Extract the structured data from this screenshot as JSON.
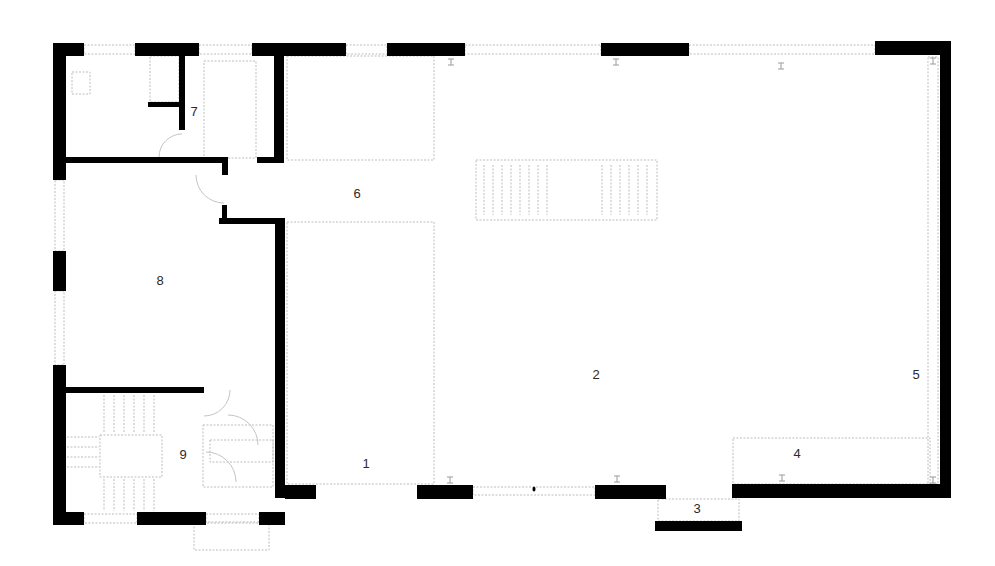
{
  "plan": {
    "title": "Floor plan",
    "background": "#ffffff",
    "wall_color": "#000000",
    "line_color": "#bdbdbd"
  },
  "rooms": [
    {
      "id": "1",
      "label": "1",
      "x": 366,
      "y": 465
    },
    {
      "id": "2",
      "label": "2",
      "x": 596,
      "y": 376
    },
    {
      "id": "3",
      "label": "3",
      "x": 697,
      "y": 510
    },
    {
      "id": "4",
      "label": "4",
      "x": 797,
      "y": 455
    },
    {
      "id": "5",
      "label": "5",
      "x": 916,
      "y": 376
    },
    {
      "id": "6",
      "label": "6",
      "x": 357,
      "y": 195
    },
    {
      "id": "7",
      "label": "7",
      "x": 194,
      "y": 113
    },
    {
      "id": "8",
      "label": "8",
      "x": 160,
      "y": 282
    },
    {
      "id": "9",
      "label": "9",
      "x": 183,
      "y": 456
    }
  ],
  "walls": [
    {
      "x": 53,
      "y": 43,
      "w": 31,
      "h": 13
    },
    {
      "x": 53,
      "y": 43,
      "w": 13,
      "h": 137
    },
    {
      "x": 135,
      "y": 43,
      "w": 64,
      "h": 13
    },
    {
      "x": 252,
      "y": 43,
      "w": 94,
      "h": 13
    },
    {
      "x": 387,
      "y": 43,
      "w": 78,
      "h": 13
    },
    {
      "x": 601,
      "y": 43,
      "w": 88,
      "h": 13
    },
    {
      "x": 875,
      "y": 41,
      "w": 76,
      "h": 14
    },
    {
      "x": 940,
      "y": 41,
      "w": 11,
      "h": 455
    },
    {
      "x": 179,
      "y": 56,
      "w": 6,
      "h": 74
    },
    {
      "x": 148,
      "y": 102,
      "w": 37,
      "h": 5
    },
    {
      "x": 274,
      "y": 56,
      "w": 10,
      "h": 107
    },
    {
      "x": 257,
      "y": 157,
      "w": 27,
      "h": 6
    },
    {
      "x": 66,
      "y": 157,
      "w": 162,
      "h": 6
    },
    {
      "x": 222,
      "y": 157,
      "w": 6,
      "h": 18
    },
    {
      "x": 222,
      "y": 205,
      "w": 5,
      "h": 17
    },
    {
      "x": 219,
      "y": 218,
      "w": 66,
      "h": 6
    },
    {
      "x": 275,
      "y": 218,
      "w": 10,
      "h": 280
    },
    {
      "x": 53,
      "y": 251,
      "w": 13,
      "h": 40
    },
    {
      "x": 53,
      "y": 365,
      "w": 13,
      "h": 160
    },
    {
      "x": 66,
      "y": 387,
      "w": 138,
      "h": 6
    },
    {
      "x": 53,
      "y": 512,
      "w": 31,
      "h": 13
    },
    {
      "x": 137,
      "y": 512,
      "w": 69,
      "h": 13
    },
    {
      "x": 259,
      "y": 512,
      "w": 26,
      "h": 13
    },
    {
      "x": 285,
      "y": 485,
      "w": 31,
      "h": 14
    },
    {
      "x": 417,
      "y": 485,
      "w": 56,
      "h": 14
    },
    {
      "x": 595,
      "y": 485,
      "w": 71,
      "h": 14
    },
    {
      "x": 655,
      "y": 521,
      "w": 87,
      "h": 10
    },
    {
      "x": 732,
      "y": 484,
      "w": 219,
      "h": 14
    }
  ],
  "thin_rects": [
    {
      "x": 84,
      "y": 45,
      "w": 51,
      "h": 9
    },
    {
      "x": 199,
      "y": 45,
      "w": 53,
      "h": 9
    },
    {
      "x": 346,
      "y": 45,
      "w": 41,
      "h": 9
    },
    {
      "x": 465,
      "y": 45,
      "w": 136,
      "h": 9
    },
    {
      "x": 689,
      "y": 45,
      "w": 186,
      "h": 9
    },
    {
      "x": 55,
      "y": 180,
      "w": 9,
      "h": 71
    },
    {
      "x": 55,
      "y": 291,
      "w": 9,
      "h": 74
    },
    {
      "x": 84,
      "y": 514,
      "w": 53,
      "h": 9
    },
    {
      "x": 206,
      "y": 514,
      "w": 53,
      "h": 9
    },
    {
      "x": 473,
      "y": 487,
      "w": 122,
      "h": 8
    },
    {
      "x": 928,
      "y": 57,
      "w": 10,
      "h": 427
    },
    {
      "x": 287,
      "y": 56,
      "w": 147,
      "h": 104
    },
    {
      "x": 287,
      "y": 222,
      "w": 147,
      "h": 262
    },
    {
      "x": 733,
      "y": 438,
      "w": 197,
      "h": 46
    },
    {
      "x": 194,
      "y": 522,
      "w": 75,
      "h": 28
    },
    {
      "x": 658,
      "y": 499,
      "w": 81,
      "h": 22
    },
    {
      "x": 476,
      "y": 160,
      "w": 181,
      "h": 60
    },
    {
      "x": 100,
      "y": 435,
      "w": 62,
      "h": 42
    },
    {
      "x": 203,
      "y": 425,
      "w": 70,
      "h": 62
    },
    {
      "x": 210,
      "y": 440,
      "w": 63,
      "h": 22
    },
    {
      "x": 204,
      "y": 61,
      "w": 52,
      "h": 97
    },
    {
      "x": 72,
      "y": 72,
      "w": 18,
      "h": 22
    },
    {
      "x": 150,
      "y": 56,
      "w": 29,
      "h": 46
    }
  ],
  "door_swings": [
    {
      "cx": 182,
      "cy": 157,
      "r": 23,
      "start": 180,
      "end": 270
    },
    {
      "cx": 224,
      "cy": 175,
      "r": 28,
      "start": 90,
      "end": 180,
      "flip": true
    },
    {
      "cx": 204,
      "cy": 390,
      "r": 26,
      "start": 0,
      "end": 90
    },
    {
      "cx": 228,
      "cy": 445,
      "r": 30,
      "start": 270,
      "end": 360
    },
    {
      "cx": 206,
      "cy": 482,
      "r": 30,
      "start": 270,
      "end": 360
    }
  ],
  "ibeams": [
    {
      "x": 451,
      "y": 62
    },
    {
      "x": 616,
      "y": 62
    },
    {
      "x": 781,
      "y": 66
    },
    {
      "x": 933,
      "y": 61
    },
    {
      "x": 450,
      "y": 480
    },
    {
      "x": 617,
      "y": 479
    },
    {
      "x": 782,
      "y": 478
    },
    {
      "x": 933,
      "y": 480
    }
  ],
  "stair_main": {
    "x": 476,
    "y": 160,
    "w": 181,
    "h": 60,
    "treads_left": 8,
    "treads_right": 6
  },
  "stair_core": {
    "x": 66,
    "y": 393,
    "treads_top": 6,
    "treads_bottom": 6
  }
}
